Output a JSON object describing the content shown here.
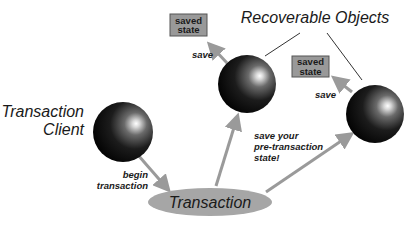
{
  "diagram": {
    "title": "Recoverable Objects",
    "nodes": {
      "client": {
        "label_line1": "Transaction",
        "label_line2": "Client"
      },
      "transaction": {
        "label": "Transaction"
      },
      "object1": {
        "saved_state_line1": "saved",
        "saved_state_line2": "state",
        "save_label": "save"
      },
      "object2": {
        "saved_state_line1": "saved",
        "saved_state_line2": "state",
        "save_label": "save"
      }
    },
    "edges": {
      "begin": {
        "line1": "begin",
        "line2": "transaction"
      },
      "save_state": {
        "line1": "save your",
        "line2": "pre-transaction",
        "line3": "state!"
      }
    },
    "colors": {
      "arrow": "#9a9a9a",
      "ellipse": "#a6a6a6",
      "box_fill": "#999999",
      "box_border": "#555555",
      "sphere_dark": "#000000",
      "sphere_highlight": "#ffffff",
      "line": "#333333"
    }
  }
}
